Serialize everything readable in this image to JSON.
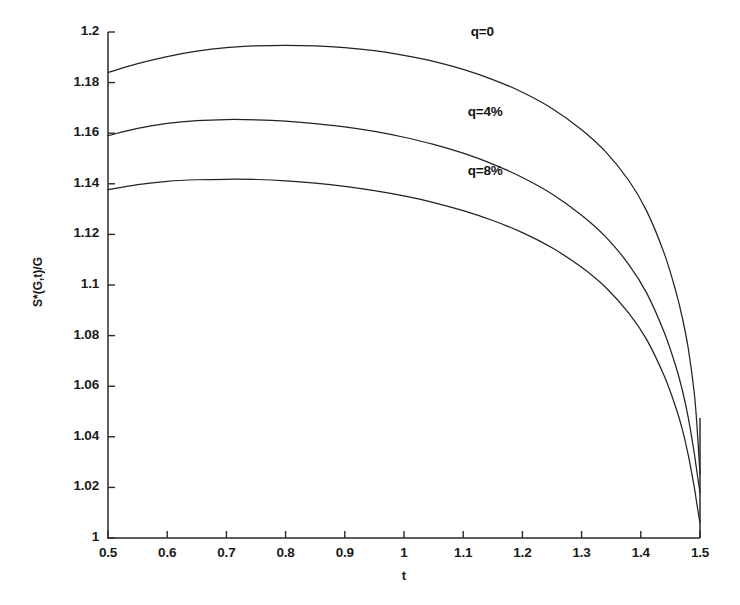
{
  "chart_data": {
    "type": "line",
    "title": "",
    "subtitle": "",
    "xlabel": "t",
    "ylabel": "S*(G,t)/G",
    "xlim": [
      0.5,
      1.5
    ],
    "ylim": [
      1.0,
      1.2
    ],
    "xticks": [
      0.5,
      0.6,
      0.7,
      0.8,
      0.9,
      1.0,
      1.1,
      1.2,
      1.3,
      1.4,
      1.5
    ],
    "xtick_labels": [
      "0.5",
      "0.6",
      "0.7",
      "0.8",
      "0.9",
      "1",
      "1.1",
      "1.2",
      "1.3",
      "1.4",
      "1.5"
    ],
    "yticks": [
      1.0,
      1.02,
      1.04,
      1.06,
      1.08,
      1.1,
      1.12,
      1.14,
      1.16,
      1.18,
      1.2
    ],
    "ytick_labels": [
      "1",
      "1.02",
      "1.04",
      "1.06",
      "1.08",
      "1.1",
      "1.12",
      "1.14",
      "1.16",
      "1.18",
      "1.2"
    ],
    "grid": false,
    "legend_position": "inline-annotations",
    "line_color": "#222222",
    "series": [
      {
        "name": "q=0",
        "annotation": "q=0",
        "annotation_x": 1.16,
        "annotation_y": 1.1995,
        "x": [
          0.5,
          0.55,
          0.6,
          0.65,
          0.7,
          0.75,
          0.8,
          0.85,
          0.9,
          0.95,
          1.0,
          1.05,
          1.1,
          1.15,
          1.2,
          1.25,
          1.3,
          1.34,
          1.38,
          1.41,
          1.44,
          1.46,
          1.47,
          1.48,
          1.49,
          1.495,
          1.5
        ],
        "y": [
          1.184,
          1.1875,
          1.1903,
          1.1924,
          1.1938,
          1.1945,
          1.1947,
          1.1945,
          1.1938,
          1.1926,
          1.1908,
          1.1884,
          1.1852,
          1.1812,
          1.1762,
          1.1698,
          1.1614,
          1.1528,
          1.1412,
          1.1292,
          1.1122,
          1.0968,
          1.0872,
          1.0752,
          1.058,
          1.044,
          1.025
        ]
      },
      {
        "name": "q=4%",
        "annotation": "q=4%",
        "annotation_x": 1.155,
        "annotation_y": 1.168,
        "x": [
          0.5,
          0.55,
          0.6,
          0.65,
          0.7,
          0.75,
          0.8,
          0.85,
          0.9,
          0.95,
          1.0,
          1.05,
          1.1,
          1.15,
          1.2,
          1.25,
          1.3,
          1.34,
          1.38,
          1.41,
          1.44,
          1.46,
          1.47,
          1.48,
          1.49,
          1.495,
          1.5
        ],
        "y": [
          1.159,
          1.1619,
          1.1639,
          1.165,
          1.1654,
          1.1653,
          1.1648,
          1.1638,
          1.1625,
          1.1607,
          1.1584,
          1.1556,
          1.1521,
          1.1478,
          1.1425,
          1.136,
          1.1276,
          1.1192,
          1.108,
          1.0968,
          1.081,
          1.0672,
          1.0586,
          1.0478,
          1.034,
          1.0258,
          1.018
        ]
      },
      {
        "name": "q=8%",
        "annotation": "q=8%",
        "annotation_x": 1.155,
        "annotation_y": 1.1445,
        "x": [
          0.5,
          0.55,
          0.6,
          0.65,
          0.7,
          0.75,
          0.8,
          0.85,
          0.9,
          0.95,
          1.0,
          1.05,
          1.1,
          1.15,
          1.2,
          1.25,
          1.3,
          1.34,
          1.38,
          1.41,
          1.44,
          1.46,
          1.47,
          1.48,
          1.49,
          1.495,
          1.5
        ],
        "y": [
          1.1377,
          1.1397,
          1.141,
          1.1416,
          1.1418,
          1.1417,
          1.1412,
          1.1403,
          1.139,
          1.1373,
          1.1352,
          1.1326,
          1.1294,
          1.1255,
          1.1207,
          1.1147,
          1.107,
          1.0992,
          1.0888,
          1.0784,
          1.0638,
          1.051,
          1.043,
          1.033,
          1.0205,
          1.013,
          1.006
        ]
      }
    ]
  }
}
